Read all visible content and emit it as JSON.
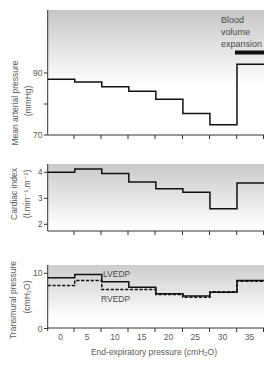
{
  "chart_data": [
    {
      "type": "line",
      "step": true,
      "title": "",
      "ylabel": "Mean arterial pressure (mmHg)",
      "ylabel_main": "Mean arterial pressure",
      "ylabel_unit": "(mmHg)",
      "xlabel": "End-expiratory pressure (cmH₂O)",
      "x": [
        0,
        5,
        10,
        15,
        20,
        25,
        30,
        35
      ],
      "ylim": [
        70,
        110
      ],
      "yticks": [
        70,
        80,
        90
      ],
      "ytick_labels": {
        "70": "70",
        "90": "90"
      },
      "grid": false,
      "series": [
        {
          "name": "Mean arterial pressure",
          "style": "solid",
          "values": [
            88.0,
            87.1,
            85.6,
            84.1,
            81.5,
            76.9,
            73.3,
            92.8
          ]
        }
      ],
      "annotation": {
        "lines": [
          "Blood",
          "volume",
          "expansion"
        ],
        "bar_x_range": [
          32.5,
          37.5
        ]
      }
    },
    {
      "type": "line",
      "step": true,
      "title": "",
      "ylabel": "Cardiac index (l.min⁻¹.m⁻²)",
      "ylabel_main": "Cardiac index",
      "ylabel_unit": "(l.min⁻¹.m⁻²)",
      "xlabel": "End-expiratory pressure (cmH₂O)",
      "x": [
        0,
        5,
        10,
        15,
        20,
        25,
        30,
        35
      ],
      "ylim": [
        1.75,
        4.3
      ],
      "yticks": [
        2,
        3,
        4
      ],
      "ytick_labels": {
        "2": "2",
        "3": "3",
        "4": "4"
      },
      "grid": false,
      "series": [
        {
          "name": "Cardiac index",
          "style": "solid",
          "values": [
            4.0,
            4.13,
            3.95,
            3.63,
            3.37,
            3.23,
            2.6,
            3.59
          ]
        }
      ]
    },
    {
      "type": "line",
      "step": true,
      "title": "",
      "ylabel": "Transmural pressure (cmH₂O)",
      "ylabel_main": "Transmural pressure",
      "ylabel_unit": "(cmH₂O)",
      "xlabel": "End-expiratory pressure (cmH₂O)",
      "x": [
        0,
        5,
        10,
        15,
        20,
        25,
        30,
        35
      ],
      "xtick_labels": [
        "0",
        "5",
        "10",
        "15",
        "20",
        "25",
        "30",
        "35"
      ],
      "ylim": [
        0,
        11.5
      ],
      "yticks": [
        0,
        10
      ],
      "ytick_labels": {
        "0": "0",
        "10": "10"
      },
      "grid": false,
      "series": [
        {
          "name": "LVEDP",
          "style": "solid",
          "values": [
            9.2,
            9.8,
            8.5,
            7.5,
            6.3,
            5.9,
            6.6,
            8.7
          ]
        },
        {
          "name": "RVEDP",
          "style": "dashed",
          "values": [
            7.8,
            8.7,
            7.1,
            7.1,
            6.2,
            5.7,
            6.7,
            8.6
          ]
        }
      ]
    }
  ],
  "figure": {
    "xlabel": "End-expiratory pressure (cmH₂O)",
    "colors": {
      "line": "#111111",
      "text": "#5a5a5a",
      "panel_shade_top": "#c6c6c6",
      "panel_shade_bottom": "#ffffff"
    }
  }
}
